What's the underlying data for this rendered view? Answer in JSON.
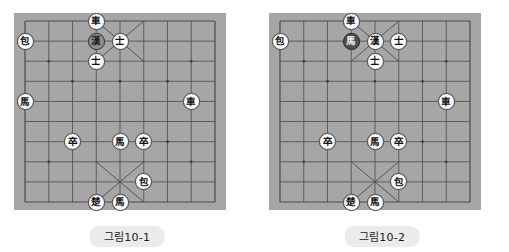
{
  "page": {
    "background_color": "#ffffff",
    "width": 509,
    "height": 252
  },
  "board_style": {
    "board_color": "#a6a6a6",
    "line_color": "#4a4a4a",
    "piece_fill": "#fbfbfb",
    "piece_text": "#111111",
    "dark_piece_fill": "#4f4f4f",
    "shade_piece_fill": "#8f8f8f",
    "caption_bg": "#ebebeb",
    "columns": 9,
    "rows": 10
  },
  "figures": [
    {
      "id": "figure-10-1",
      "caption": "그림10-1",
      "pieces": [
        {
          "label": "車",
          "col": 3,
          "row": 0,
          "style": "light",
          "name": "piece-chariot-han"
        },
        {
          "label": "包",
          "col": 0,
          "row": 1,
          "style": "light",
          "name": "piece-cannon-han"
        },
        {
          "label": "漢",
          "col": 3,
          "row": 1,
          "style": "shade",
          "name": "piece-general-han"
        },
        {
          "label": "士",
          "col": 4,
          "row": 1,
          "style": "light",
          "name": "piece-guard-han-1"
        },
        {
          "label": "士",
          "col": 3,
          "row": 2,
          "style": "light",
          "name": "piece-guard-han-2"
        },
        {
          "label": "馬",
          "col": 0,
          "row": 4,
          "style": "light",
          "name": "piece-horse-han"
        },
        {
          "label": "車",
          "col": 7,
          "row": 4,
          "style": "light",
          "name": "piece-chariot-cho"
        },
        {
          "label": "卒",
          "col": 2,
          "row": 6,
          "style": "light",
          "name": "piece-soldier-cho-1"
        },
        {
          "label": "馬",
          "col": 4,
          "row": 6,
          "style": "light",
          "name": "piece-horse-cho"
        },
        {
          "label": "卒",
          "col": 5,
          "row": 6,
          "style": "light",
          "name": "piece-soldier-cho-2"
        },
        {
          "label": "包",
          "col": 5,
          "row": 8,
          "style": "light",
          "name": "piece-cannon-cho"
        },
        {
          "label": "楚",
          "col": 3,
          "row": 9,
          "style": "light",
          "name": "piece-general-cho"
        },
        {
          "label": "馬",
          "col": 4,
          "row": 9,
          "style": "light",
          "name": "piece-horse-cho-2"
        }
      ]
    },
    {
      "id": "figure-10-2",
      "caption": "그림10-2",
      "pieces": [
        {
          "label": "車",
          "col": 3,
          "row": 0,
          "style": "light",
          "name": "piece-chariot-han"
        },
        {
          "label": "包",
          "col": 0,
          "row": 1,
          "style": "light",
          "name": "piece-cannon-han"
        },
        {
          "label": "馬",
          "col": 3,
          "row": 1,
          "style": "dark",
          "name": "piece-horse-highlighted"
        },
        {
          "label": "漢",
          "col": 4,
          "row": 1,
          "style": "light",
          "name": "piece-general-han"
        },
        {
          "label": "士",
          "col": 5,
          "row": 1,
          "style": "light",
          "name": "piece-guard-han-1"
        },
        {
          "label": "士",
          "col": 4,
          "row": 2,
          "style": "light",
          "name": "piece-guard-han-2"
        },
        {
          "label": "車",
          "col": 7,
          "row": 4,
          "style": "light",
          "name": "piece-chariot-cho"
        },
        {
          "label": "卒",
          "col": 2,
          "row": 6,
          "style": "light",
          "name": "piece-soldier-cho-1"
        },
        {
          "label": "馬",
          "col": 4,
          "row": 6,
          "style": "light",
          "name": "piece-horse-cho"
        },
        {
          "label": "卒",
          "col": 5,
          "row": 6,
          "style": "light",
          "name": "piece-soldier-cho-2"
        },
        {
          "label": "包",
          "col": 5,
          "row": 8,
          "style": "light",
          "name": "piece-cannon-cho"
        },
        {
          "label": "楚",
          "col": 3,
          "row": 9,
          "style": "light",
          "name": "piece-general-cho"
        },
        {
          "label": "馬",
          "col": 4,
          "row": 9,
          "style": "light",
          "name": "piece-horse-cho-2"
        }
      ]
    }
  ]
}
